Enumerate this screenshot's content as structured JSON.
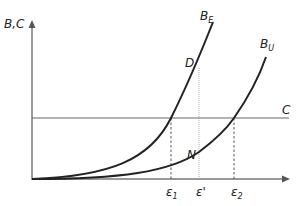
{
  "diagram": {
    "y_axis_label": "B,C",
    "curves": [
      {
        "name": "B",
        "subscript": "E"
      },
      {
        "name": "B",
        "subscript": "U"
      }
    ],
    "cost_line_label": "C",
    "points": {
      "D": "D",
      "N": "N"
    },
    "x_ticks": [
      {
        "name": "ε",
        "subscript": "1"
      },
      {
        "name": "ε'",
        "subscript": ""
      },
      {
        "name": "ε",
        "subscript": "2"
      }
    ],
    "colors": {
      "axis": "#777777",
      "curve": "#222222",
      "cost_line": "#666666",
      "dashed": "#555555"
    }
  }
}
